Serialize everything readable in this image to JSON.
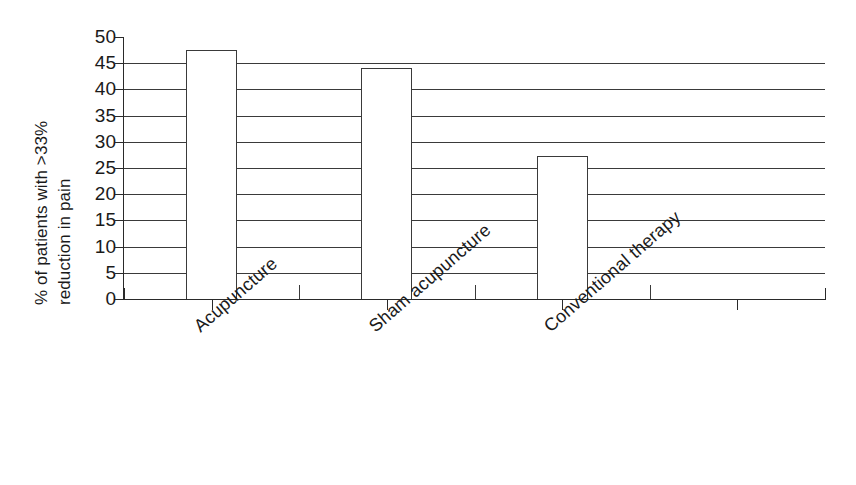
{
  "chart_data": {
    "type": "bar",
    "title": "",
    "subtitle": "",
    "xlabel": "",
    "ylabel": "% of patients with >33% reduction in pain",
    "ylabel_lines": [
      "% of patients with >33%",
      "reduction in pain"
    ],
    "categories": [
      "Acupuncture",
      "Sham acupuncture",
      "Conventional therapy",
      ""
    ],
    "values": [
      47.5,
      44.0,
      27.3,
      null
    ],
    "ylim": [
      0,
      50
    ],
    "ytick_step": 5,
    "yticks": [
      50,
      45,
      40,
      35,
      30,
      25,
      20,
      15,
      10,
      5,
      0
    ],
    "ytick_labels": [
      "50",
      "45",
      "40",
      "35",
      "30",
      "25",
      "20",
      "15",
      "10",
      "5",
      "0"
    ],
    "grid": true,
    "grid_axis": "y",
    "legend": false,
    "legend_position": "none",
    "bar_fill": "#ffffff",
    "bar_edge": "#3a3a3a",
    "background": "#ffffff",
    "text_color": "#1a1a1a",
    "xtick_rotation": -41,
    "series": [
      {
        "name": "% of patients with >33% reduction in pain",
        "values": [
          47.5,
          44.0,
          27.3,
          null
        ]
      }
    ],
    "bars": [
      {
        "category": "Acupuncture",
        "value": 47.5
      },
      {
        "category": "Sham acupuncture",
        "value": 44.0
      },
      {
        "category": "Conventional therapy",
        "value": 27.3
      },
      {
        "category": "",
        "value": null
      }
    ]
  }
}
